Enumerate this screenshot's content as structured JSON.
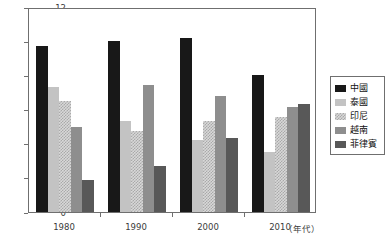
{
  "chart_data": {
    "type": "bar",
    "title": "",
    "xlabel": "（年代）",
    "ylabel": "",
    "categories": [
      "1980",
      "1990",
      "2000",
      "2010"
    ],
    "ylim": [
      0,
      12
    ],
    "yticks": [
      0,
      2,
      4,
      6,
      8,
      10,
      12
    ],
    "ytick_labels": [
      "0",
      "2",
      "4",
      "6",
      "8",
      "10",
      "12"
    ],
    "grid": false,
    "legend_position": "right",
    "series": [
      {
        "name": "中國",
        "color": "#181818",
        "pattern": "solid",
        "values": [
          9.7,
          10.0,
          10.2,
          8.0
        ]
      },
      {
        "name": "泰國",
        "color": "#c3c3c3",
        "pattern": "solid",
        "values": [
          7.3,
          5.35,
          4.2,
          3.5
        ]
      },
      {
        "name": "印尼",
        "color": "#d8d8d8",
        "pattern": "checkered",
        "values": [
          6.5,
          4.75,
          5.3,
          5.55
        ]
      },
      {
        "name": "越南",
        "color": "#8e8e8e",
        "pattern": "solid",
        "values": [
          5.0,
          7.45,
          6.8,
          6.15
        ]
      },
      {
        "name": "菲律賓",
        "color": "#585858",
        "pattern": "solid",
        "values": [
          1.9,
          2.7,
          4.35,
          6.35
        ]
      }
    ]
  },
  "legend": {
    "items": [
      {
        "label": "中國"
      },
      {
        "label": "泰國"
      },
      {
        "label": "印尼"
      },
      {
        "label": "越南"
      },
      {
        "label": "菲律賓"
      }
    ]
  },
  "axes": {
    "x_unit_label": "（年代）"
  }
}
